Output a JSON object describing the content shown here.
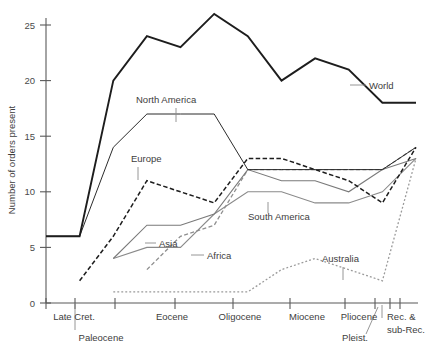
{
  "chart_data": {
    "type": "line",
    "title": "",
    "xlabel": "",
    "ylabel": "Number of orders present",
    "ylim": [
      0,
      26.5
    ],
    "yticks": [
      0,
      5,
      10,
      15,
      20,
      25
    ],
    "grid": false,
    "legend_position": "inline-annotations",
    "x_categories": [
      "Late Cret.",
      "Paleocene",
      "Eocene",
      "Oligocene",
      "Miocene",
      "Pliocene",
      "Pleist.",
      "Rec. & sub-Rec."
    ],
    "x_tick_positions": [
      0,
      1,
      2,
      4,
      6,
      8,
      9,
      10
    ],
    "x": [
      0,
      1,
      2,
      3,
      4,
      5,
      6,
      7,
      8,
      9,
      10,
      11
    ],
    "series": [
      {
        "name": "World",
        "style": "solid-thick-black",
        "color": "#1d1d1d",
        "values": [
          6,
          6,
          20,
          24,
          23,
          26,
          24,
          20,
          22,
          21,
          18,
          18
        ]
      },
      {
        "name": "North America",
        "style": "solid-thin-black",
        "color": "#2b2b2b",
        "values": [
          6,
          6,
          14,
          17,
          17,
          17,
          12,
          12,
          12,
          12,
          12,
          14
        ]
      },
      {
        "name": "Europe",
        "style": "dashed-black",
        "color": "#1d1d1d",
        "values": [
          null,
          2,
          6,
          11,
          10,
          9,
          13,
          13,
          12,
          11,
          9,
          14
        ]
      },
      {
        "name": "Asia",
        "style": "solid-gray",
        "color": "#7a7a7a",
        "values": [
          null,
          null,
          4,
          7,
          7,
          8,
          12,
          11,
          11,
          10,
          12,
          13
        ]
      },
      {
        "name": "Africa",
        "style": "dashed-gray",
        "color": "#8f8f8f",
        "values": [
          null,
          null,
          null,
          3,
          6,
          7,
          12,
          12,
          12,
          12,
          12,
          14
        ]
      },
      {
        "name": "South America",
        "style": "solid-gray",
        "color": "#8a8a8a",
        "values": [
          null,
          null,
          4,
          5,
          5,
          8,
          10,
          10,
          9,
          9,
          10,
          13
        ]
      },
      {
        "name": "Australia",
        "style": "dotted-gray",
        "color": "#9a9a9a",
        "values": [
          null,
          null,
          1,
          1,
          1,
          1,
          1,
          3,
          4,
          3,
          2,
          13
        ]
      }
    ],
    "annotations": [
      {
        "label": "World",
        "x": 348,
        "y": 86,
        "leader": "left"
      },
      {
        "label": "North America",
        "x": 135,
        "y": 100,
        "leader": "down"
      },
      {
        "label": "Europe",
        "x": 130,
        "y": 159,
        "leader": "down"
      },
      {
        "label": "Asia",
        "x": 157,
        "y": 244,
        "leader": "left-up"
      },
      {
        "label": "Africa",
        "x": 205,
        "y": 256,
        "leader": "left-up"
      },
      {
        "label": "South America",
        "x": 268,
        "y": 217,
        "leader": "down"
      },
      {
        "label": "Australia",
        "x": 327,
        "y": 259,
        "leader": "down"
      }
    ]
  }
}
